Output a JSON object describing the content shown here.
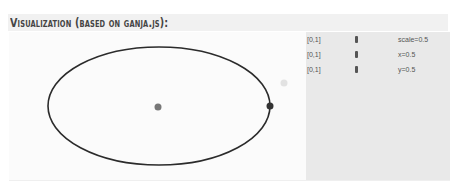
{
  "heading": {
    "title": "Visualization (based on ganja.js):"
  },
  "visualization": {
    "ellipse": {
      "cx": 150,
      "cy": 74,
      "rx": 111,
      "ry": 59,
      "stroke": "#2b2b2b"
    },
    "points": [
      {
        "name": "center-point",
        "cx": 149,
        "cy": 75,
        "r": 3.5,
        "color": "#777777"
      },
      {
        "name": "ellipse-point",
        "cx": 261,
        "cy": 74,
        "r": 3.5,
        "color": "#333333"
      },
      {
        "name": "faint-point",
        "cx": 275,
        "cy": 51,
        "r": 3.5,
        "color": "#e2e2e2"
      }
    ]
  },
  "controls": [
    {
      "range": "[0,1]",
      "label": "scale=0.5",
      "value": 0.5
    },
    {
      "range": "[0,1]",
      "label": "x=0.5",
      "value": 0.5
    },
    {
      "range": "[0,1]",
      "label": "y=0.5",
      "value": 0.5
    }
  ]
}
